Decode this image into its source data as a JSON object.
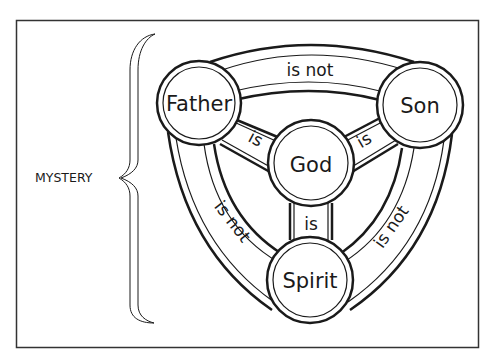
{
  "diagram": {
    "type": "shield-of-the-trinity",
    "side_label": "MYSTERY",
    "nodes": {
      "father": "Father",
      "son": "Son",
      "spirit": "Spirit",
      "god": "God"
    },
    "edges": {
      "father_son": "is not",
      "father_spirit": "is not",
      "son_spirit": "is not",
      "father_god": "is",
      "son_god": "is",
      "spirit_god": "is"
    },
    "colors": {
      "stroke": "#1a1a1a",
      "background": "#ffffff",
      "frame": "#333333"
    }
  }
}
